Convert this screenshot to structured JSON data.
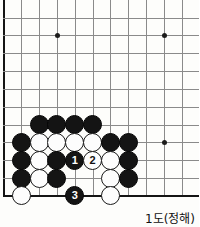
{
  "figure": {
    "kind": "go-problem-diagram",
    "caption": "1도(정해)",
    "board": {
      "columns": 11,
      "rows": 11,
      "cell_px": 17.83,
      "origin_x": 3.5,
      "origin_y": 17.6,
      "edges": [
        "left",
        "bottom"
      ],
      "line_color": "#8a8a8a",
      "edge_color": "#141414",
      "background": "#fdfdfb"
    },
    "star_points": [
      {
        "col": 3,
        "row": 1
      },
      {
        "col": 9,
        "row": 1
      },
      {
        "col": 9,
        "row": 7
      }
    ],
    "stones": [
      {
        "col": 2,
        "row": 6,
        "color": "black",
        "label": ""
      },
      {
        "col": 3,
        "row": 6,
        "color": "black",
        "label": ""
      },
      {
        "col": 4,
        "row": 6,
        "color": "black",
        "label": ""
      },
      {
        "col": 5,
        "row": 6,
        "color": "black",
        "label": ""
      },
      {
        "col": 1,
        "row": 7,
        "color": "black",
        "label": ""
      },
      {
        "col": 2,
        "row": 7,
        "color": "white",
        "label": ""
      },
      {
        "col": 3,
        "row": 7,
        "color": "white",
        "label": ""
      },
      {
        "col": 4,
        "row": 7,
        "color": "white",
        "label": ""
      },
      {
        "col": 5,
        "row": 7,
        "color": "white",
        "label": ""
      },
      {
        "col": 6,
        "row": 7,
        "color": "black",
        "label": ""
      },
      {
        "col": 7,
        "row": 7,
        "color": "black",
        "label": ""
      },
      {
        "col": 1,
        "row": 8,
        "color": "black",
        "label": ""
      },
      {
        "col": 2,
        "row": 8,
        "color": "white",
        "label": ""
      },
      {
        "col": 3,
        "row": 8,
        "color": "black",
        "label": ""
      },
      {
        "col": 4,
        "row": 8,
        "color": "black",
        "label": "1"
      },
      {
        "col": 5,
        "row": 8,
        "color": "white",
        "label": "2"
      },
      {
        "col": 6,
        "row": 8,
        "color": "white",
        "label": ""
      },
      {
        "col": 7,
        "row": 8,
        "color": "black",
        "label": ""
      },
      {
        "col": 1,
        "row": 9,
        "color": "black",
        "label": ""
      },
      {
        "col": 2,
        "row": 9,
        "color": "white",
        "label": ""
      },
      {
        "col": 3,
        "row": 9,
        "color": "black",
        "label": ""
      },
      {
        "col": 6,
        "row": 9,
        "color": "white",
        "label": ""
      },
      {
        "col": 7,
        "row": 9,
        "color": "black",
        "label": ""
      },
      {
        "col": 1,
        "row": 10,
        "color": "white",
        "label": ""
      },
      {
        "col": 4,
        "row": 10,
        "color": "black",
        "label": "3"
      },
      {
        "col": 6,
        "row": 10,
        "color": "white",
        "label": ""
      }
    ],
    "moves": [
      {
        "number": "1",
        "color": "black",
        "col": 4,
        "row": 8
      },
      {
        "number": "2",
        "color": "white",
        "col": 5,
        "row": 8
      },
      {
        "number": "3",
        "color": "black",
        "col": 4,
        "row": 10
      }
    ]
  }
}
